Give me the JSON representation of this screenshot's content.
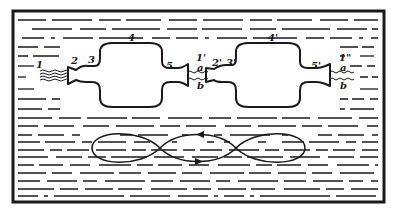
{
  "diagram": {
    "colors": {
      "ink": "#1a1a1a",
      "background": "#ffffff"
    },
    "labels": {
      "inlet": "1",
      "neck_in": "2",
      "shoulder_in": "3",
      "chamber": "4",
      "neck_out": "5",
      "inlet_2": "1'",
      "a_top_1": "a",
      "b_bottom_1": "b",
      "neck_in_2": "2'",
      "shoulder_in_2": "3'",
      "chamber_2": "4'",
      "neck_out_2": "5'",
      "outlet": "1\"",
      "a_top_2": "a",
      "b_bottom_2": "b"
    },
    "loop": {
      "lobes": 3,
      "arrows": [
        "top-pointing-left",
        "bottom-pointing-right"
      ]
    }
  }
}
